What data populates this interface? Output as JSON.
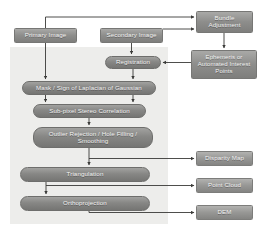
{
  "diagram": {
    "canvas": {
      "width": 268,
      "height": 237,
      "background": "#ffffff"
    },
    "panel": {
      "name": "core-pipeline-backdrop",
      "color": "#ededeb",
      "x": 10,
      "y": 47,
      "w": 158,
      "h": 177
    },
    "palette": {
      "node_fill_dark": "#8e8e8c",
      "node_fill_light": "#979795",
      "node_text": "#f2f2f2",
      "connector": "#3a3a38",
      "panel_bg": "#ededeb",
      "page_bg": "#ffffff"
    },
    "nodes": [
      {
        "id": "primary_image",
        "label": "Primary Image",
        "shape": "rect",
        "x": 14,
        "y": 28,
        "w": 63,
        "h": 15,
        "font": 6.2
      },
      {
        "id": "secondary_image",
        "label": "Secondary Image",
        "shape": "rect",
        "x": 100,
        "y": 28,
        "w": 63,
        "h": 15,
        "font": 6.2
      },
      {
        "id": "bundle_adjustment",
        "label": "Bundle Adjustment",
        "shape": "rect",
        "x": 196,
        "y": 11,
        "w": 57,
        "h": 22,
        "font": 6.2
      },
      {
        "id": "ephemeris",
        "label": "Ephemeris or Automated Interest Points",
        "shape": "rect",
        "x": 191,
        "y": 50,
        "w": 66,
        "h": 29,
        "font": 6.0
      },
      {
        "id": "registration",
        "label": "Registration",
        "shape": "pill",
        "x": 105,
        "y": 56,
        "w": 56,
        "h": 13,
        "font": 6.2
      },
      {
        "id": "mask_log",
        "label": "Mask / Sign of Laplacian of Gaussian",
        "shape": "pill",
        "x": 22,
        "y": 81,
        "w": 134,
        "h": 14,
        "font": 6.2
      },
      {
        "id": "stereo_correlation",
        "label": "Sub-pixel Stereo Correlation",
        "shape": "pill",
        "x": 33,
        "y": 104,
        "w": 113,
        "h": 14,
        "font": 6.2
      },
      {
        "id": "outlier_rejection",
        "label": "Outlier Rejection / Hole Filling / Smoothing",
        "shape": "pill",
        "x": 33,
        "y": 127,
        "w": 120,
        "h": 21,
        "font": 6.2
      },
      {
        "id": "triangulation",
        "label": "Triangulation",
        "shape": "pill",
        "x": 20,
        "y": 167,
        "w": 130,
        "h": 15,
        "font": 6.2
      },
      {
        "id": "orthoprojection",
        "label": "Orthoprojection",
        "shape": "pill",
        "x": 20,
        "y": 196,
        "w": 130,
        "h": 15,
        "font": 6.2
      },
      {
        "id": "disparity_map",
        "label": "Disparity Map",
        "shape": "chip",
        "x": 196,
        "y": 151,
        "w": 57,
        "h": 15,
        "font": 6.2
      },
      {
        "id": "point_cloud",
        "label": "Point Cloud",
        "shape": "chip",
        "x": 196,
        "y": 178,
        "w": 57,
        "h": 15,
        "font": 6.2
      },
      {
        "id": "dem",
        "label": "DEM",
        "shape": "chip",
        "x": 196,
        "y": 205,
        "w": 57,
        "h": 15,
        "font": 6.2
      }
    ],
    "connectors": [
      {
        "id": "primary-to-bundle",
        "from": "primary_image",
        "to": "bundle_adjustment"
      },
      {
        "id": "secondary-to-bundle",
        "from": "secondary_image",
        "to": "bundle_adjustment"
      },
      {
        "id": "bundle-to-ephemeris",
        "from": "bundle_adjustment",
        "to": "ephemeris"
      },
      {
        "id": "ephemeris-to-registration",
        "from": "ephemeris",
        "to": "registration"
      },
      {
        "id": "secondary-to-registration",
        "from": "secondary_image",
        "to": "registration"
      },
      {
        "id": "registration-to-mask",
        "from": "registration",
        "to": "mask_log"
      },
      {
        "id": "primary-to-mask",
        "from": "primary_image",
        "to": "mask_log"
      },
      {
        "id": "mask-to-correlation",
        "from": "mask_log",
        "to": "stereo_correlation"
      },
      {
        "id": "correlation-to-outlier",
        "from": "stereo_correlation",
        "to": "outlier_rejection"
      },
      {
        "id": "outlier-to-triangulation",
        "from": "outlier_rejection",
        "to": "triangulation"
      },
      {
        "id": "outlier-to-disparity",
        "from": "outlier_rejection",
        "to": "disparity_map"
      },
      {
        "id": "triangulation-to-ortho",
        "from": "triangulation",
        "to": "orthoprojection"
      },
      {
        "id": "triangulation-to-point-cloud",
        "from": "triangulation",
        "to": "point_cloud"
      },
      {
        "id": "ortho-to-dem",
        "from": "orthoprojection",
        "to": "dem"
      }
    ]
  }
}
